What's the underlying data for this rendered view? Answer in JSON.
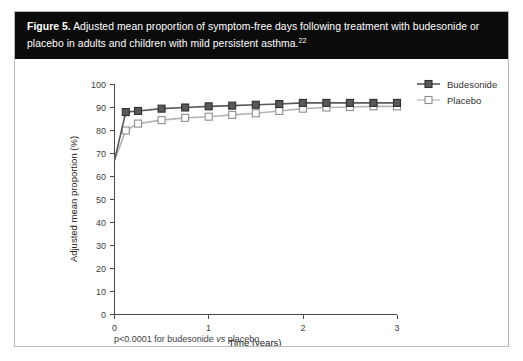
{
  "figure": {
    "label": "Figure 5.",
    "caption_line1": "Adjusted mean proportion of symptom-free days following treatment with budesonide or",
    "caption_line2": "placebo in adults and children with mild persistent asthma.",
    "caption_reference": "22"
  },
  "footnote": {
    "prefix": "p<0.0001 for budesonide ",
    "italic": "vs",
    "suffix": " placebo"
  },
  "legend": {
    "position": "top-right",
    "items": [
      {
        "label": "Budesonide",
        "marker": "filled-square",
        "color": "#595959"
      },
      {
        "label": "Placebo",
        "marker": "open-square",
        "color": "#b5b5b5"
      }
    ]
  },
  "colors": {
    "caption_background": "#0b0b0b",
    "caption_text": "#ffffff",
    "axis": "#4a4a4a",
    "budesonide": "#595959",
    "placebo": "#b5b5b5",
    "frame_border": "#b9b9b9"
  },
  "chart_data": {
    "type": "line",
    "title": "Adjusted mean proportion of symptom-free days following treatment with budesonide or placebo in adults and children with mild persistent asthma.",
    "xlabel": "Time (years)",
    "ylabel": "Adjusted mean proportion (%)",
    "xlim": [
      0,
      3
    ],
    "ylim": [
      0,
      100
    ],
    "xticks": [
      0,
      1,
      2,
      3
    ],
    "xtick_labels": [
      "0",
      "1",
      "2",
      "3"
    ],
    "yticks": [
      0,
      10,
      20,
      30,
      40,
      50,
      60,
      70,
      80,
      90,
      100
    ],
    "ytick_labels": [
      "0",
      "10",
      "20",
      "30",
      "40",
      "50",
      "60",
      "70",
      "80",
      "90",
      "100"
    ],
    "grid": false,
    "legend_position": "top right",
    "x": [
      0,
      0.12,
      0.25,
      0.5,
      0.75,
      1.0,
      1.25,
      1.5,
      1.75,
      2.0,
      2.25,
      2.5,
      2.75,
      3.0
    ],
    "series": [
      {
        "name": "Budesonide",
        "marker": "filled-square",
        "color": "#595959",
        "values": [
          67,
          88,
          88.5,
          89.5,
          90,
          90.5,
          90.8,
          91.2,
          91.5,
          92,
          92,
          92,
          92,
          92
        ]
      },
      {
        "name": "Placebo",
        "marker": "open-square",
        "color": "#b5b5b5",
        "values": [
          67,
          80,
          83,
          84.5,
          85.5,
          86,
          86.8,
          87.5,
          88.5,
          89.5,
          90,
          90.2,
          90.5,
          90.5
        ]
      }
    ]
  }
}
